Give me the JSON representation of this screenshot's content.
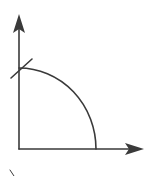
{
  "diagram": {
    "type": "axes-with-quarter-arc",
    "stroke_color": "#3a3a3a",
    "background": "#ffffff",
    "elements": [
      {
        "name": "y-axis",
        "kind": "arrow",
        "from": [
          19,
          149
        ],
        "to": [
          19,
          14
        ]
      },
      {
        "name": "x-axis",
        "kind": "arrow",
        "from": [
          19,
          149
        ],
        "to": [
          144,
          149
        ]
      },
      {
        "name": "quarter-arc",
        "kind": "arc",
        "center": [
          19,
          149
        ],
        "rx": 77,
        "ry": 81
      },
      {
        "name": "tangent-mark",
        "kind": "segment",
        "from": [
          11,
          78
        ],
        "to": [
          32,
          59
        ]
      },
      {
        "name": "corner-mark",
        "kind": "segment",
        "from": [
          10,
          170
        ],
        "to": [
          14,
          176
        ]
      }
    ]
  }
}
